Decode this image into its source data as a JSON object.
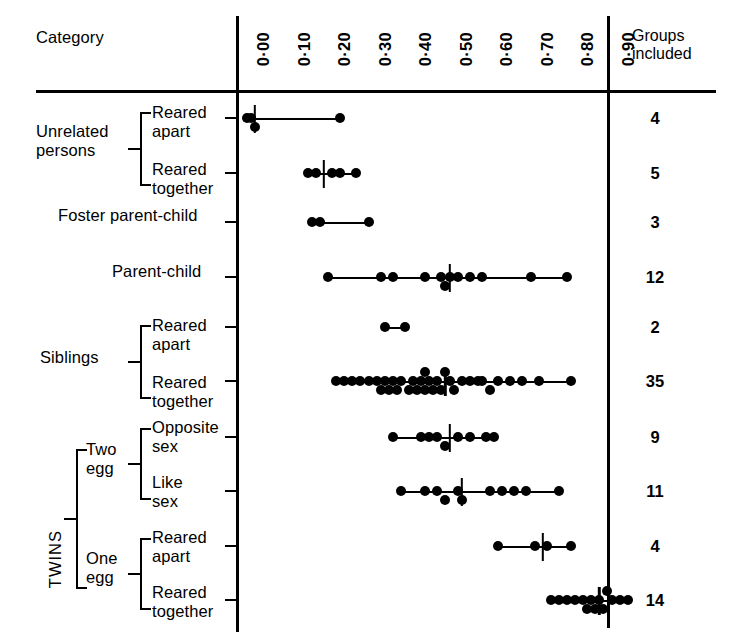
{
  "header": {
    "category_label": "Category",
    "groups_line1": "Groups",
    "groups_line2": "included"
  },
  "axis": {
    "tick_labels": [
      "0·00",
      "0·10",
      "0·20",
      "0·30",
      "0·40",
      "0·50",
      "0·60",
      "0·70",
      "0·80",
      "0·90"
    ],
    "tick_values": [
      0.0,
      0.1,
      0.2,
      0.3,
      0.4,
      0.5,
      0.6,
      0.7,
      0.8,
      0.9
    ]
  },
  "brackets": {
    "unrelated_label": "Unrelated\npersons",
    "foster_label": "Foster parent-child",
    "parent_child_label": "Parent-child",
    "siblings_label": "Siblings",
    "twins_label": "TWINS",
    "two_egg_label": "Two\negg",
    "one_egg_label": "One\negg",
    "reared_apart_label": "Reared\napart",
    "reared_together_label": "Reared\ntogether",
    "opposite_sex_label": "Opposite\nsex",
    "like_sex_label": "Like\nsex"
  },
  "chart_data": {
    "type": "scatter",
    "title": "",
    "xlabel": "",
    "ylabel": "",
    "xlim": [
      0.0,
      0.95
    ],
    "grid": false,
    "legend": null,
    "annotations": [
      "Vertical stroke on each row marks the median correlation."
    ],
    "rows": [
      {
        "category": "Unrelated persons",
        "subcategory": "Reared apart",
        "groups_included": "4",
        "median": 0.02,
        "range": [
          0.0,
          0.23
        ],
        "values": [
          0.0,
          0.01,
          0.02,
          0.23
        ]
      },
      {
        "category": "Unrelated persons",
        "subcategory": "Reared together",
        "groups_included": "5",
        "median": 0.19,
        "range": [
          0.15,
          0.27
        ],
        "values": [
          0.15,
          0.17,
          0.21,
          0.23,
          0.27
        ]
      },
      {
        "category": "Foster parent-child",
        "subcategory": "",
        "groups_included": "3",
        "median": null,
        "range": [
          0.16,
          0.3
        ],
        "values": [
          0.16,
          0.18,
          0.3
        ]
      },
      {
        "category": "Parent-child",
        "subcategory": "",
        "groups_included": "12",
        "median": 0.5,
        "range": [
          0.2,
          0.8
        ],
        "values": [
          0.2,
          0.33,
          0.36,
          0.44,
          0.48,
          0.49,
          0.5,
          0.52,
          0.55,
          0.58,
          0.7,
          0.79
        ]
      },
      {
        "category": "Siblings",
        "subcategory": "Reared apart",
        "groups_included": "2",
        "median": null,
        "range": [
          0.34,
          0.39
        ],
        "values": [
          0.34,
          0.39
        ]
      },
      {
        "category": "Siblings",
        "subcategory": "Reared together",
        "groups_included": "35",
        "median": 0.49,
        "range": [
          0.22,
          0.8
        ],
        "values": [
          0.22,
          0.24,
          0.26,
          0.28,
          0.3,
          0.32,
          0.33,
          0.34,
          0.35,
          0.36,
          0.37,
          0.38,
          0.4,
          0.41,
          0.42,
          0.43,
          0.44,
          0.44,
          0.45,
          0.46,
          0.47,
          0.48,
          0.49,
          0.5,
          0.51,
          0.53,
          0.55,
          0.57,
          0.58,
          0.6,
          0.62,
          0.65,
          0.68,
          0.72,
          0.8
        ]
      },
      {
        "category": "TWINS / Two egg",
        "subcategory": "Opposite sex",
        "groups_included": "9",
        "median": 0.5,
        "range": [
          0.36,
          0.62
        ],
        "values": [
          0.36,
          0.43,
          0.45,
          0.47,
          0.49,
          0.52,
          0.55,
          0.59,
          0.61
        ]
      },
      {
        "category": "TWINS / Two egg",
        "subcategory": "Like sex",
        "groups_included": "11",
        "median": 0.53,
        "range": [
          0.38,
          0.77
        ],
        "values": [
          0.38,
          0.44,
          0.47,
          0.49,
          0.52,
          0.53,
          0.6,
          0.63,
          0.66,
          0.69,
          0.77
        ]
      },
      {
        "category": "TWINS / One egg",
        "subcategory": "Reared apart",
        "groups_included": "4",
        "median": 0.73,
        "range": [
          0.62,
          0.8
        ],
        "values": [
          0.62,
          0.71,
          0.74,
          0.8
        ]
      },
      {
        "category": "TWINS / One egg",
        "subcategory": "Reared together",
        "groups_included": "14",
        "median": 0.87,
        "range": [
          0.75,
          0.94
        ],
        "values": [
          0.75,
          0.77,
          0.79,
          0.81,
          0.83,
          0.84,
          0.85,
          0.86,
          0.87,
          0.88,
          0.89,
          0.9,
          0.92,
          0.94
        ]
      }
    ]
  }
}
